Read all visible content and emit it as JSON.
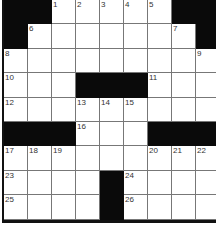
{
  "puzzle": {
    "rows": 9,
    "cols": 9,
    "colors": {
      "block": "#0a0a0a",
      "cell": "#ffffff",
      "line": "#777777"
    },
    "grid": [
      [
        "#",
        "#",
        "1",
        "2",
        "3",
        "4",
        "5",
        "#",
        "#"
      ],
      [
        "#",
        "6",
        "",
        "",
        "",
        "",
        "",
        "7",
        "#"
      ],
      [
        "8",
        "",
        "",
        "",
        "",
        "",
        "",
        "",
        "9"
      ],
      [
        "10",
        "",
        "",
        "#",
        "#",
        "#",
        "11",
        "",
        ""
      ],
      [
        "12",
        "",
        "",
        "13",
        "14",
        "15",
        "",
        "",
        ""
      ],
      [
        "#",
        "#",
        "#",
        "16",
        "",
        "",
        "#",
        "#",
        "#"
      ],
      [
        "17",
        "18",
        "19",
        "",
        "",
        "",
        "20",
        "21",
        "22"
      ],
      [
        "23",
        "",
        "",
        "",
        "#",
        "24",
        "",
        "",
        ""
      ],
      [
        "25",
        "",
        "",
        "",
        "#",
        "26",
        "",
        "",
        ""
      ]
    ]
  }
}
